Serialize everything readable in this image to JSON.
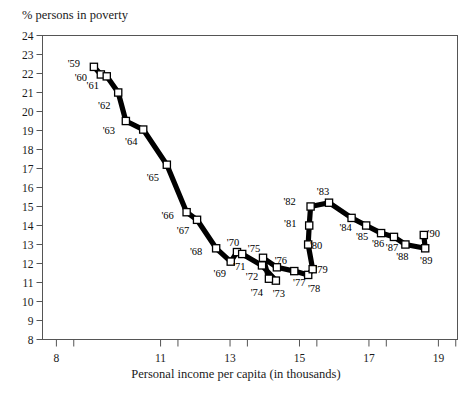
{
  "chart_data": {
    "type": "line",
    "title": "",
    "subtitle": "",
    "xlabel": "Personal income per capita (in thousands)",
    "ylabel": "% persons in poverty",
    "xlim": [
      7.6,
      19.55
    ],
    "ylim": [
      8,
      24
    ],
    "grid": false,
    "legend": null,
    "marker": "open-square",
    "line_style": "thick-solid-black",
    "x_major_ticks": [
      8,
      11,
      13,
      15,
      17,
      19
    ],
    "x_tick_labels": [
      "8",
      "11",
      "13",
      "15",
      "17",
      "19"
    ],
    "x_all_ticks": [
      8,
      8.5,
      11,
      11.5,
      13,
      13.5,
      15,
      15.5,
      17,
      17.5,
      19,
      19.5
    ],
    "y_ticks": [
      8,
      9,
      10,
      11,
      12,
      13,
      14,
      15,
      16,
      17,
      18,
      19,
      20,
      21,
      22,
      23,
      24
    ],
    "y_tick_labels": [
      "8",
      "9",
      "10",
      "11",
      "12",
      "13",
      "14",
      "15",
      "16",
      "17",
      "18",
      "19",
      "20",
      "21",
      "22",
      "23",
      "24"
    ],
    "point_label_prefix": "'",
    "series": [
      {
        "name": "Poverty rate vs personal income per capita",
        "points": [
          {
            "label": "'59",
            "x": 9.08,
            "y": 22.35,
            "lx": -20,
            "ly": 0
          },
          {
            "label": "'60",
            "x": 9.28,
            "y": 21.95,
            "lx": -20,
            "ly": 7
          },
          {
            "label": "'61",
            "x": 9.45,
            "y": 21.85,
            "lx": -14,
            "ly": 13
          },
          {
            "label": "'62",
            "x": 9.78,
            "y": 21.0,
            "lx": -14,
            "ly": 16
          },
          {
            "label": "'63",
            "x": 10.0,
            "y": 19.5,
            "lx": -17,
            "ly": 13
          },
          {
            "label": "'64",
            "x": 10.5,
            "y": 19.05,
            "lx": -12,
            "ly": 15
          },
          {
            "label": "'65",
            "x": 11.18,
            "y": 17.2,
            "lx": -14,
            "ly": 16
          },
          {
            "label": "'66",
            "x": 11.75,
            "y": 14.7,
            "lx": -19,
            "ly": 7
          },
          {
            "label": "'67",
            "x": 12.05,
            "y": 14.3,
            "lx": -14,
            "ly": 14
          },
          {
            "label": "'68",
            "x": 12.6,
            "y": 12.8,
            "lx": -20,
            "ly": 7
          },
          {
            "label": "'69",
            "x": 13.02,
            "y": 12.1,
            "lx": -11,
            "ly": 15
          },
          {
            "label": "'70",
            "x": 13.2,
            "y": 12.6,
            "lx": -4,
            "ly": -6
          },
          {
            "label": "'71",
            "x": 13.35,
            "y": 12.5,
            "lx": -3,
            "ly": 16
          },
          {
            "label": "'72",
            "x": 13.92,
            "y": 11.9,
            "lx": -10,
            "ly": 15
          },
          {
            "label": "'73",
            "x": 14.32,
            "y": 11.1,
            "lx": 3,
            "ly": 16
          },
          {
            "label": "'74",
            "x": 14.12,
            "y": 11.2,
            "lx": -12,
            "ly": 17
          },
          {
            "label": "'75",
            "x": 13.95,
            "y": 12.3,
            "lx": -9,
            "ly": -6
          },
          {
            "label": "'76",
            "x": 14.35,
            "y": 11.8,
            "lx": 4,
            "ly": -3
          },
          {
            "label": "'77",
            "x": 14.85,
            "y": 11.6,
            "lx": 5,
            "ly": 15
          },
          {
            "label": "'78",
            "x": 15.25,
            "y": 11.4,
            "lx": 6,
            "ly": 17
          },
          {
            "label": "'79",
            "x": 15.38,
            "y": 11.7,
            "lx": 9,
            "ly": 4
          },
          {
            "label": "'80",
            "x": 15.25,
            "y": 13.0,
            "lx": 8,
            "ly": 4
          },
          {
            "label": "'81",
            "x": 15.28,
            "y": 14.0,
            "lx": -19,
            "ly": 1
          },
          {
            "label": "'82",
            "x": 15.32,
            "y": 15.0,
            "lx": -21,
            "ly": -2
          },
          {
            "label": "'83",
            "x": 15.85,
            "y": 15.2,
            "lx": -6,
            "ly": -8
          },
          {
            "label": "'84",
            "x": 16.5,
            "y": 14.4,
            "lx": -6,
            "ly": 13
          },
          {
            "label": "'85",
            "x": 16.92,
            "y": 14.0,
            "lx": -4,
            "ly": 14
          },
          {
            "label": "'86",
            "x": 17.35,
            "y": 13.6,
            "lx": -3,
            "ly": 14
          },
          {
            "label": "'87",
            "x": 17.72,
            "y": 13.4,
            "lx": -2,
            "ly": 14
          },
          {
            "label": "'88",
            "x": 18.05,
            "y": 13.0,
            "lx": -3,
            "ly": 15
          },
          {
            "label": "'89",
            "x": 18.62,
            "y": 12.8,
            "lx": 1,
            "ly": 16
          },
          {
            "label": "'90",
            "x": 18.58,
            "y": 13.5,
            "lx": 10,
            "ly": 2
          }
        ]
      }
    ]
  },
  "axes": {
    "x_axis_title": "Personal income per capita (in thousands)",
    "y_axis_title": "% persons in poverty"
  }
}
